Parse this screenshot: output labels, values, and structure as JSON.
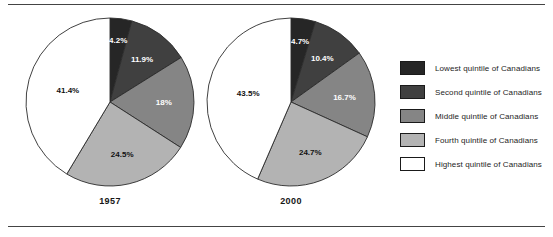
{
  "figure": {
    "rule_color": "#444444",
    "background": "#ffffff"
  },
  "legend": {
    "position": "right",
    "items": [
      {
        "label": "Lowest quintile of Canadians",
        "color": "#262626"
      },
      {
        "label": "Second quintile of Canadians",
        "color": "#404040"
      },
      {
        "label": "Middle quintile of Canadians",
        "color": "#858585"
      },
      {
        "label": "Fourth quintile of Canadians",
        "color": "#b3b3b3"
      },
      {
        "label": "Highest quintile of Canadians",
        "color": "#ffffff"
      }
    ]
  },
  "chart_data": [
    {
      "type": "pie",
      "title": "1957",
      "categories": [
        "Lowest quintile of Canadians",
        "Second quintile of Canadians",
        "Middle quintile of Canadians",
        "Fourth quintile of Canadians",
        "Highest quintile of Canadians"
      ],
      "values": [
        4.2,
        11.9,
        18.0,
        24.5,
        41.4
      ],
      "labels": [
        "4.2%",
        "11.9%",
        "18%",
        "24.5%",
        "41.4%"
      ],
      "colors": [
        "#262626",
        "#404040",
        "#858585",
        "#b3b3b3",
        "#ffffff"
      ],
      "start_angle_deg": 0,
      "direction": "clockwise",
      "xlabel": "",
      "ylabel": ""
    },
    {
      "type": "pie",
      "title": "2000",
      "categories": [
        "Lowest quintile of Canadians",
        "Second quintile of Canadians",
        "Middle quintile of Canadians",
        "Fourth quintile of Canadians",
        "Highest quintile of Canadians"
      ],
      "values": [
        4.7,
        10.4,
        16.7,
        24.7,
        43.5
      ],
      "labels": [
        "4.7%",
        "10.4%",
        "16.7%",
        "24.7%",
        "43.5%"
      ],
      "colors": [
        "#262626",
        "#404040",
        "#858585",
        "#b3b3b3",
        "#ffffff"
      ],
      "start_angle_deg": 0,
      "direction": "clockwise",
      "xlabel": "",
      "ylabel": ""
    }
  ]
}
